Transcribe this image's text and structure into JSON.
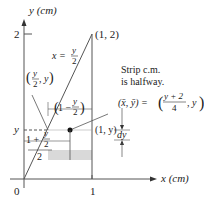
{
  "axes": {
    "y_label": "y (cm)",
    "x_label": "x (cm)",
    "y_tick_2": "2",
    "y_tick_y": "y",
    "origin": "0",
    "x_tick_1": "1"
  },
  "curves": {
    "line_label_lhs": "x =",
    "line_label_num": "y",
    "line_label_den": "2",
    "top_point": "(1, 2)"
  },
  "points": {
    "left_point_num": "y",
    "left_point_den": "2",
    "left_point_suffix": ", y",
    "right_point": "(1, y)"
  },
  "annotations": {
    "strip_note_line1": "Strip c.m.",
    "strip_note_line2": "is halfway.",
    "cm_lhs": "(x̄, ȳ) =",
    "cm_num": "y + 2",
    "cm_den": "4",
    "cm_suffix": ", y",
    "width_label_prefix": "1 −",
    "width_label_num": "y",
    "width_label_den": "2",
    "half_label_prefix": "1 +",
    "half_label_num": "y",
    "half_label_den": "2",
    "half_label_outer_den": "2",
    "dy_label": "dy"
  },
  "colors": {
    "line": "#555555",
    "strip": "#d9d9d9",
    "text": "#222222"
  }
}
